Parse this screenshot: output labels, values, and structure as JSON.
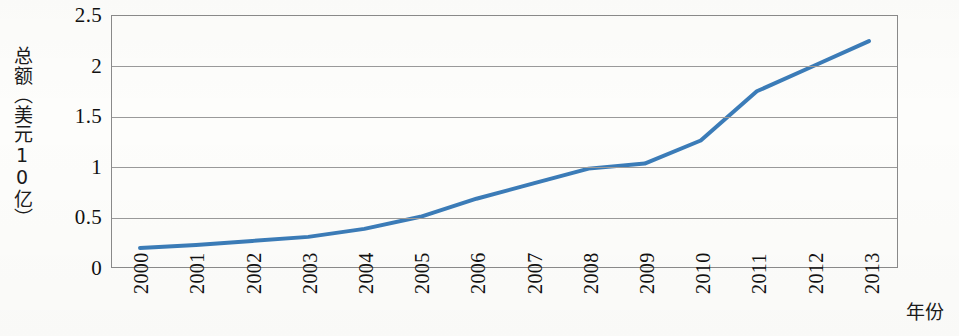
{
  "chart_data": {
    "type": "line",
    "title": "",
    "subtitle": "",
    "xlabel": "年份",
    "ylabel": "总额（美元10亿）",
    "categories": [
      "2000",
      "2001",
      "2002",
      "2003",
      "2004",
      "2005",
      "2006",
      "2007",
      "2008",
      "2009",
      "2010",
      "2011",
      "2012",
      "2013"
    ],
    "series": [
      {
        "name": "总额",
        "color": "#3b7cb8",
        "values": [
          0.19,
          0.22,
          0.26,
          0.3,
          0.38,
          0.5,
          0.68,
          0.83,
          0.98,
          1.03,
          1.26,
          1.75,
          2.0,
          2.25
        ]
      }
    ],
    "ylim": [
      0,
      2.5
    ],
    "yticks": [
      0,
      0.5,
      1,
      1.5,
      2,
      2.5
    ],
    "ytick_labels": [
      "0",
      "0.5",
      "1",
      "1.5",
      "2",
      "2.5"
    ],
    "xtick_labels": [
      "2000",
      "2001",
      "2002",
      "2003",
      "2004",
      "2005",
      "2006",
      "2007",
      "2008",
      "2009",
      "2010",
      "2011",
      "2012",
      "2013"
    ],
    "grid": true,
    "grid_axis": "y",
    "legend": false,
    "legend_position": "none",
    "xtick_rotation": -90,
    "line_width": 4,
    "markers": false
  },
  "axes": {
    "y_title": "总额（美元10亿）",
    "x_title": "年份"
  },
  "colors": {
    "series_blue": "#3b7cb8",
    "gridline": "#9a9a9a",
    "axis_border": "#8a8a8a",
    "background": "#fdfdfb",
    "text": "#111111"
  }
}
